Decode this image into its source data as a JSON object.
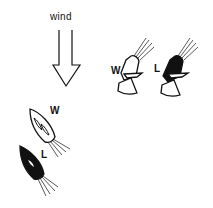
{
  "diagram": {
    "wind_label": "wind",
    "windward_label_top": "W",
    "leeward_label_top": "L",
    "windward_label_bottom": "W",
    "leeward_label_bottom": "L",
    "colors": {
      "ink": "#111111",
      "background": "#ffffff",
      "windward_fill": "#ffffff",
      "leeward_fill": "#111111"
    }
  }
}
